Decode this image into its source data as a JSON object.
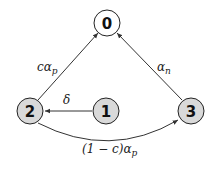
{
  "diagram": {
    "type": "state-transition-graph",
    "colors": {
      "node_fill_absorbing": "#ffffff",
      "node_fill_transient": "#d9d9d9",
      "node_stroke": "#222222",
      "edge": "#333333"
    },
    "nodes": [
      {
        "id": "0",
        "label": "0",
        "fill": "white",
        "x": 107,
        "y": 23
      },
      {
        "id": "1",
        "label": "1",
        "fill": "gray",
        "x": 106,
        "y": 111
      },
      {
        "id": "2",
        "label": "2",
        "fill": "gray",
        "x": 30,
        "y": 111
      },
      {
        "id": "3",
        "label": "3",
        "fill": "gray",
        "x": 191,
        "y": 111
      }
    ],
    "edges": [
      {
        "from": "2",
        "to": "0",
        "label": "cα",
        "sub": "p"
      },
      {
        "from": "3",
        "to": "0",
        "label": "α",
        "sub": "n"
      },
      {
        "from": "1",
        "to": "2",
        "label": "δ",
        "sub": ""
      },
      {
        "from": "2",
        "to": "3",
        "label": "(1 − c)α",
        "sub": "p",
        "curved": true
      }
    ]
  }
}
